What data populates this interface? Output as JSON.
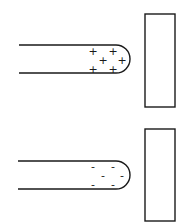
{
  "diagram": {
    "colors": {
      "stroke": "#1a1a1a",
      "background": "#ffffff"
    },
    "panels": [
      {
        "name": "positive-rod-panel",
        "rod": {
          "charge_sign": "positive",
          "symbol": "+",
          "charges": [
            "+",
            "+",
            "+",
            "+",
            "+",
            "+"
          ]
        },
        "plate": {
          "label": ""
        }
      },
      {
        "name": "negative-rod-panel",
        "rod": {
          "charge_sign": "negative",
          "symbol": "-",
          "charges": [
            "-",
            "-",
            "-",
            "-",
            "-",
            "-"
          ]
        },
        "plate": {
          "label": ""
        }
      }
    ]
  }
}
